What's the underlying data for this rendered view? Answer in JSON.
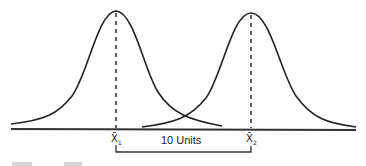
{
  "diagram": {
    "distributions": [
      {
        "name": "distribution-1",
        "mean_label": "X̄",
        "subscript": "1",
        "peak_x": 116,
        "peak_y": 11
      },
      {
        "name": "distribution-2",
        "mean_label": "X̄",
        "subscript": "2",
        "peak_x": 251,
        "peak_y": 13
      }
    ],
    "separation_label": "10 Units",
    "colors": {
      "line": "#222222",
      "background": "#ffffff"
    }
  }
}
